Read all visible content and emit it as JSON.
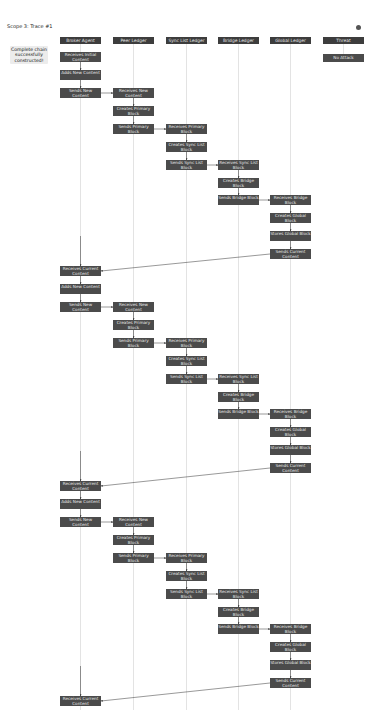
{
  "title": "Scope 3: Trace #1",
  "status": "Complete chain successfully constructed!",
  "colors": {
    "node": "#4b4b4b",
    "header": "#3d3d3d",
    "lifeline": "#d0d0d0",
    "arrow": "#333333",
    "status_bg": "#ececec"
  },
  "lanes": [
    {
      "label": "Broker Agent",
      "x": 60
    },
    {
      "label": "Peer Ledger",
      "x": 113
    },
    {
      "label": "Sync List Ledger",
      "x": 166
    },
    {
      "label": "Bridge Ledger",
      "x": 218
    },
    {
      "label": "Global Ledger",
      "x": 270
    },
    {
      "label": "Threat",
      "x": 323
    }
  ],
  "threat_node": "No Attack",
  "loop_labels": {
    "broker_first": "Receives Initial Content",
    "broker_recv": "Receives Current Content",
    "broker_add": "Adds New Content",
    "broker_send": "Sends New Content",
    "peer_recv": "Receives New Content",
    "peer_create": "Creates Primary Block",
    "peer_send": "Sends Primary Block",
    "sync_recv": "Receives Primary Block",
    "sync_create": "Creates Sync List Block",
    "sync_send": "Sends Sync List Block",
    "bridge_recv": "Receives Sync List Block",
    "bridge_create": "Creates Bridge Block",
    "bridge_send": "Sends Bridge Block",
    "global_recv": "Receives Bridge Block",
    "global_create": "Creates Global Block",
    "global_store": "Stores Global Block",
    "global_send": "Sends Current Content"
  },
  "loops": [
    52,
    266,
    481
  ],
  "final_receive": {
    "label": "Receives Current Content",
    "y": 696
  }
}
